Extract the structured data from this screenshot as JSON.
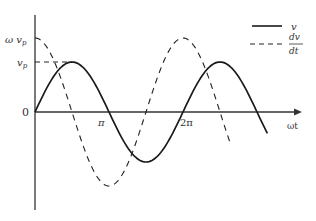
{
  "chart_data": {
    "type": "line",
    "title": "",
    "xlabel": "ωt",
    "ylabel": "",
    "x_ticks": [
      "0",
      "π",
      "2π"
    ],
    "y_ticks": [
      "0",
      "v_p",
      "ωv_p"
    ],
    "grid": false,
    "legend_position": "top-right",
    "series": [
      {
        "name": "v",
        "style": "solid",
        "function": "v_p·sin(ωt)",
        "amplitude_label": "v_p",
        "points": [
          [
            0,
            0
          ],
          [
            0.5,
            1
          ],
          [
            1,
            0
          ],
          [
            1.5,
            -1
          ],
          [
            2,
            0
          ],
          [
            2.5,
            1
          ],
          [
            3,
            0
          ],
          [
            3.15,
            -0.45
          ]
        ]
      },
      {
        "name": "dv/dt",
        "style": "dashed",
        "function": "ωv_p·cos(ωt)",
        "amplitude_label": "ωv_p",
        "points": [
          [
            0,
            1
          ],
          [
            0.5,
            0
          ],
          [
            1,
            -1
          ],
          [
            1.5,
            0
          ],
          [
            2,
            1
          ],
          [
            2.5,
            0
          ],
          [
            2.65,
            -0.45
          ]
        ]
      }
    ],
    "x_units": "multiples of π",
    "x_range": [
      0,
      3.2
    ]
  },
  "labels": {
    "origin": "0",
    "vp_main": "v",
    "vp_sub": "p",
    "wvp_main": "ω v",
    "wvp_sub": "p",
    "pi": "π",
    "two_pi": "2π",
    "x_axis": "ωt",
    "legend_v": "v",
    "legend_dv_num": "dv",
    "legend_dv_den": "dt"
  },
  "colors": {
    "line": "#1a1a1a",
    "axis": "#333333"
  }
}
